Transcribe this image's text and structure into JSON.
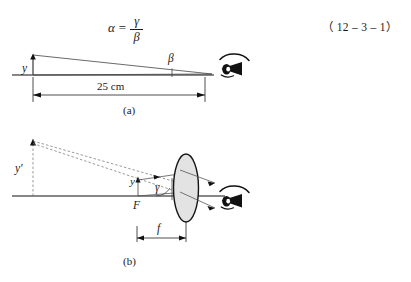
{
  "equation": {
    "lhs": "α",
    "equals": "=",
    "numerator": "γ",
    "denominator": "β",
    "number": "（ 12 – 3 – 1）"
  },
  "figure_a": {
    "caption": "(a)",
    "object_height_label": "y",
    "angle_label": "β",
    "distance_label": "25 cm",
    "eye_icon": "eye-icon"
  },
  "figure_b": {
    "caption": "(b)",
    "object_height_label": "y′",
    "image_height_label": "y",
    "angle_label": "γ",
    "focal_point_label": "F",
    "focal_length_label": "f",
    "lens_icon": "converging-lens-icon",
    "eye_icon": "eye-icon"
  },
  "colors": {
    "ink": "#1a1a1a",
    "line": "#111111",
    "ray": "#555555",
    "dashed": "#777777",
    "lens_fill": "#e3e3e3",
    "background": "#ffffff"
  }
}
